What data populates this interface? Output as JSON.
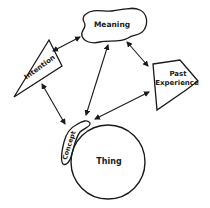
{
  "diagram": {
    "nodes": [
      {
        "id": "meaning",
        "label": "Meaning",
        "shape": "cloud"
      },
      {
        "id": "intention",
        "label": "Intention",
        "shape": "triangle"
      },
      {
        "id": "past_experience",
        "label_line1": "Past",
        "label_line2": "Experience",
        "shape": "pentagon"
      },
      {
        "id": "concept",
        "label": "Concept",
        "shape": "blob"
      },
      {
        "id": "thing",
        "label": "Thing",
        "shape": "circle"
      }
    ],
    "edges": [
      {
        "from": "meaning",
        "to": "intention",
        "type": "bidirectional"
      },
      {
        "from": "meaning",
        "to": "concept",
        "type": "bidirectional"
      },
      {
        "from": "meaning",
        "to": "past_experience",
        "type": "bidirectional"
      },
      {
        "from": "past_experience",
        "to": "concept",
        "type": "bidirectional"
      },
      {
        "from": "intention",
        "to": "concept",
        "type": "bidirectional"
      }
    ],
    "colors": {
      "stroke": "#1a1a1a",
      "background": "#ffffff"
    }
  }
}
